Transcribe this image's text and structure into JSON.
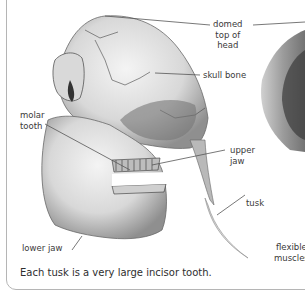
{
  "labels": {
    "domed_top": "domed\ntop of\nhead",
    "domed_top_l1": "domed",
    "domed_top_l2": "top of",
    "domed_top_l3": "head",
    "skull_bone": "skull bone",
    "molar_l1": "molar",
    "molar_l2": "tooth",
    "upper_l1": "upper",
    "upper_l2": "jaw",
    "tusk": "tusk",
    "lower_jaw": "lower jaw",
    "flexible_l1": "flexible",
    "flexible_l2": "muscles"
  },
  "caption": "Each tusk is a very large incisor tooth.",
  "colors": {
    "border": "#b5b5b5",
    "text": "#3a3a3a",
    "leader": "#555555"
  }
}
